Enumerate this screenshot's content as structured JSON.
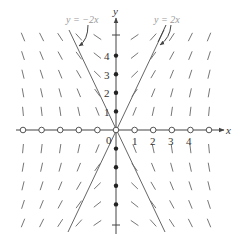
{
  "figure": {
    "type": "slope-field",
    "axes": {
      "x_label": "x",
      "y_label": "y",
      "origin_label": "0",
      "x_tick_labels": [
        "1",
        "2",
        "3",
        "4"
      ],
      "y_tick_labels": [
        "1",
        "2",
        "3",
        "4"
      ]
    },
    "isoclines": [
      {
        "label": "y = −2x",
        "slope": -2
      },
      {
        "label": "y = 2x",
        "slope": 2
      }
    ],
    "equilibrium_markers": {
      "x_axis_open_circles": [
        -5,
        -4,
        -3,
        -2,
        -1,
        0,
        1,
        2,
        3,
        4,
        5
      ],
      "y_axis_filled_dots": [
        -4,
        -3,
        -2,
        -1,
        1,
        2,
        3,
        4
      ]
    },
    "colors": {
      "axis": "#444444",
      "segments": "#666666",
      "isocline_label": "#999999",
      "background": "#ffffff"
    }
  },
  "labels": {
    "iso_left": "y = −2x",
    "iso_right": "y = 2x",
    "x_axis": "x",
    "y_axis": "y",
    "origin": "0",
    "xt1": "1",
    "xt2": "2",
    "xt3": "3",
    "xt4": "4",
    "yt1": "1",
    "yt2": "2",
    "yt3": "3",
    "yt4": "4"
  }
}
